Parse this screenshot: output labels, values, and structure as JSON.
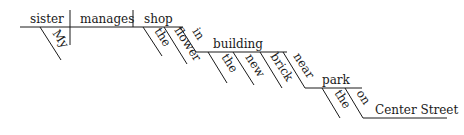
{
  "diagram": {
    "type": "sentence-diagram",
    "subject": "sister",
    "verb": "manages",
    "object": "shop",
    "modifiers": {
      "subject_det": "My",
      "object_det": "the",
      "object_adj": "flower",
      "prep1": "in",
      "prep1_object": "building",
      "prep1_det": "the",
      "prep1_adj1": "new",
      "prep1_adj2": "brick",
      "prep2": "near",
      "prep2_object": "park",
      "prep2_det": "the",
      "prep3": "on",
      "prep3_object": "Center Street"
    }
  }
}
